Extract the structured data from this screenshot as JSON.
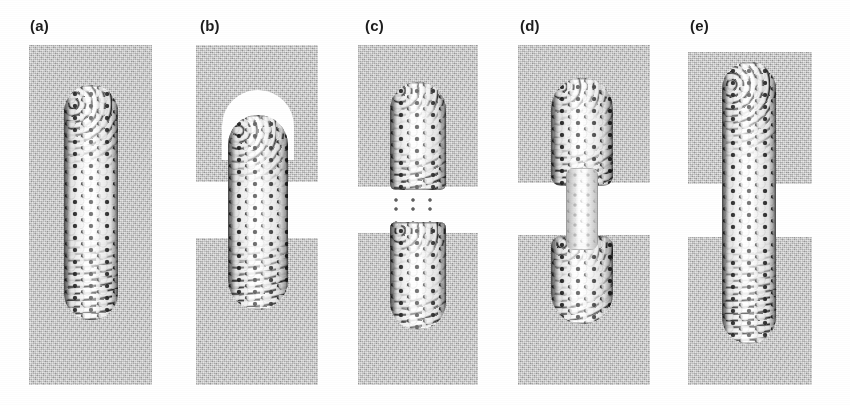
{
  "figure": {
    "kind": "molecular-simulation-panel-series",
    "background_color": "#ffffff",
    "substrate_color": "#b9b9b9",
    "gap_color": "#ffffff",
    "atom_light_color": "#ffffff",
    "atom_dark_color": "#1a1a1a",
    "panel_count": 5
  },
  "panels": [
    {
      "label": "(a)",
      "label_x": 30,
      "label_y": 17,
      "stage": "undeformed nanotube embedded in continuous substrate",
      "gap_open": false,
      "blocks": [
        {
          "x": 29,
          "y": 45,
          "w": 123,
          "h": 340
        }
      ],
      "domes": [],
      "tubes": [
        {
          "x": 64,
          "y": 85,
          "w": 54,
          "h": 235,
          "radius": "27px 27px 27px 27px",
          "style": "solid"
        }
      ],
      "fuzz": []
    },
    {
      "label": "(b)",
      "label_x": 200,
      "label_y": 17,
      "stage": "substrate separated; nanotube intact with exposed domed cap",
      "gap_open": true,
      "blocks": [
        {
          "x": 196,
          "y": 45,
          "w": 122,
          "h": 137
        },
        {
          "x": 196,
          "y": 238,
          "w": 122,
          "h": 147
        }
      ],
      "domes": [
        {
          "x": 222,
          "y": 90,
          "w": 72,
          "h": 70,
          "radius": "36px 36px 0 0"
        }
      ],
      "tubes": [
        {
          "x": 228,
          "y": 115,
          "w": 60,
          "h": 195,
          "radius": "30px 30px 30px 30px",
          "style": "solid"
        }
      ],
      "fuzz": []
    },
    {
      "label": "(c)",
      "label_x": 365,
      "label_y": 17,
      "stage": "nanotube fractured into two separated fragments with frayed ends",
      "gap_open": true,
      "blocks": [
        {
          "x": 358,
          "y": 45,
          "w": 120,
          "h": 142
        },
        {
          "x": 358,
          "y": 233,
          "w": 120,
          "h": 152
        }
      ],
      "domes": [],
      "tubes": [
        {
          "x": 390,
          "y": 82,
          "w": 56,
          "h": 108,
          "radius": "28px 28px 6px 6px",
          "style": "solid"
        },
        {
          "x": 390,
          "y": 222,
          "w": 56,
          "h": 108,
          "radius": "6px 6px 28px 28px",
          "style": "solid"
        }
      ],
      "fuzz": [
        {
          "x": 392,
          "y": 182,
          "w": 52,
          "h": 26
        },
        {
          "x": 392,
          "y": 205,
          "w": 52,
          "h": 26
        }
      ]
    },
    {
      "label": "(d)",
      "label_x": 520,
      "label_y": 17,
      "stage": "nanotube necked down to a thin constriction across the gap",
      "gap_open": true,
      "blocks": [
        {
          "x": 518,
          "y": 45,
          "w": 132,
          "h": 138
        },
        {
          "x": 518,
          "y": 235,
          "w": 132,
          "h": 150
        }
      ],
      "domes": [],
      "tubes": [
        {
          "x": 551,
          "y": 78,
          "w": 62,
          "h": 108,
          "radius": "31px 31px 10px 10px",
          "style": "solid"
        },
        {
          "x": 551,
          "y": 236,
          "w": 62,
          "h": 88,
          "radius": "10px 10px 31px 31px",
          "style": "solid"
        },
        {
          "x": 566,
          "y": 168,
          "w": 32,
          "h": 82,
          "radius": "8px",
          "style": "neck"
        }
      ],
      "fuzz": []
    },
    {
      "label": "(e)",
      "label_x": 690,
      "label_y": 17,
      "stage": "fully elongated nanotube bridging the separated substrate blocks",
      "gap_open": true,
      "blocks": [
        {
          "x": 688,
          "y": 52,
          "w": 124,
          "h": 132
        },
        {
          "x": 688,
          "y": 237,
          "w": 124,
          "h": 148
        }
      ],
      "domes": [],
      "tubes": [
        {
          "x": 722,
          "y": 62,
          "w": 54,
          "h": 282,
          "radius": "27px 27px 27px 27px",
          "style": "solid"
        }
      ],
      "fuzz": []
    }
  ]
}
